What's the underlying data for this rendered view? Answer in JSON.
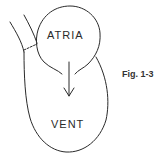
{
  "figure": {
    "caption": "Fig. 1-3",
    "labels": {
      "atria": "ATRIA",
      "ventricle": "VENT"
    },
    "colors": {
      "line": "#2a2a2a",
      "background": "#ffffff"
    }
  }
}
